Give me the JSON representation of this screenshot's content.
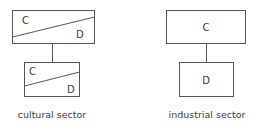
{
  "diagrams": [
    {
      "caption": "cultural sector",
      "top_box": {
        "label_upper": "C",
        "label_lower": "D"
      },
      "bottom_box": {
        "label_upper": "C",
        "label_lower": "D"
      }
    },
    {
      "caption": "industrial sector",
      "top_box": {
        "label": "C"
      },
      "bottom_box": {
        "label": "D"
      }
    }
  ],
  "colors": {
    "stroke": "#555555",
    "text": "#3a3a3a",
    "background": "#ffffff"
  }
}
